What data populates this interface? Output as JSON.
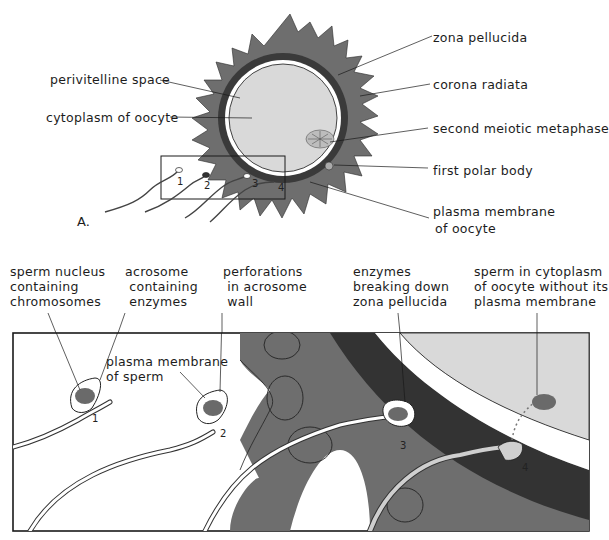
{
  "figure": {
    "panel_a": {
      "letter": "A.",
      "labels": {
        "perivitelline_space": "perivitelline space",
        "cytoplasm_of_oocyte": "cytoplasm of oocyte",
        "zona_pellucida": "zona pellucida",
        "corona_radiata": "corona radiata",
        "second_meiotic_metaphase": "second meiotic metaphase",
        "first_polar_body": "first polar body",
        "plasma_membrane_of_oocyte_1": "plasma membrane",
        "plasma_membrane_of_oocyte_2": "of oocyte"
      },
      "sperm_numbers": [
        "1",
        "2",
        "3",
        "4"
      ]
    },
    "panel_b": {
      "labels": {
        "sperm_nucleus": "sperm nucleus\ncontaining\nchromosomes",
        "acrosome": "acrosome\n containing\n enzymes",
        "perforations": "perforations\n in acrosome\n wall",
        "plasma_membrane_of_sperm": "plasma membrane\nof sperm",
        "enzymes_breaking": "enzymes\nbreaking down\nzona pellucida",
        "sperm_in_cytoplasm": "sperm in cytoplasm\nof oocyte without its\nplasma membrane"
      },
      "stage_numbers": [
        "1",
        "2",
        "3",
        "4"
      ]
    },
    "colors": {
      "corona_cells": "#6e6e6e",
      "zona_pellucida": "#3a3a3a",
      "cytoplasm": "#d9d9d9",
      "nucleus": "#6a6a6a",
      "outline": "#1a1a1a"
    }
  }
}
